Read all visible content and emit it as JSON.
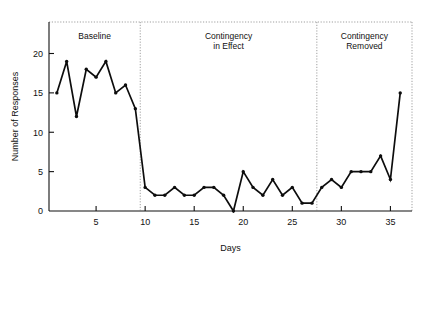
{
  "chart_data": {
    "type": "line",
    "title": "",
    "xlabel": "Days",
    "ylabel": "Number of Responses",
    "xlim": [
      0.2,
      37.2
    ],
    "ylim": [
      0,
      24
    ],
    "xticks": [
      5,
      10,
      15,
      20,
      25,
      30,
      35
    ],
    "yticks": [
      5,
      10,
      15,
      20
    ],
    "xtick_labels": [
      "5",
      "10",
      "15",
      "20",
      "25",
      "30",
      "35"
    ],
    "ytick_labels": [
      "5",
      "10",
      "15",
      "20"
    ],
    "grid": false,
    "legend": "none",
    "marker": "filled-circle",
    "line_color": "#0d0d0d",
    "series": [
      {
        "name": "Responses",
        "x": [
          1,
          2,
          3,
          4,
          5,
          6,
          7,
          8,
          9,
          10,
          11,
          12,
          13,
          14,
          15,
          16,
          17,
          18,
          19,
          20,
          21,
          22,
          23,
          24,
          25,
          26,
          27,
          28,
          29,
          30,
          31,
          32,
          33,
          34,
          35,
          36
        ],
        "values": [
          15,
          19,
          12,
          18,
          17,
          19,
          15,
          16,
          13,
          3,
          2,
          2,
          3,
          2,
          2,
          3,
          3,
          2,
          0,
          5,
          3,
          2,
          4,
          2,
          3,
          1,
          1,
          3,
          4,
          3,
          5,
          5,
          5,
          7,
          4,
          15
        ]
      }
    ],
    "phases": [
      {
        "label": "Baseline",
        "label_line_1": "Baseline",
        "label_line_2": "",
        "x_start": 0.2,
        "x_end": 9.5
      },
      {
        "label": "Contingency in Effect",
        "label_line_1": "Contingency",
        "label_line_2": "in Effect",
        "x_start": 9.5,
        "x_end": 27.5
      },
      {
        "label": "Contingency Removed",
        "label_line_1": "Contingency",
        "label_line_2": "Removed",
        "x_start": 27.5,
        "x_end": 37.2
      }
    ],
    "phase_dividers": [
      9.5,
      27.5
    ]
  }
}
